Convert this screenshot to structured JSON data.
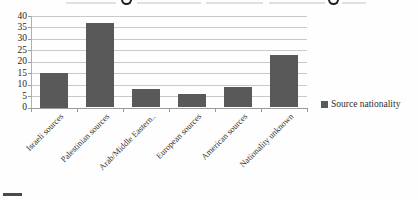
{
  "chart_data": {
    "type": "bar",
    "title": "",
    "title_note": "title cropped by screenshot edge; only letter descenders visible",
    "categories": [
      "Israeli sources",
      "Palestinian sources",
      "Arab/Middle Eastern..",
      "European sources",
      "American sources",
      "Nationality unknown"
    ],
    "values": [
      15,
      37,
      8,
      6,
      9,
      23
    ],
    "series": [
      {
        "name": "Source nationality",
        "values": [
          15,
          37,
          8,
          6,
          9,
          23
        ]
      }
    ],
    "xlabel": "",
    "ylabel": "",
    "ylim": [
      0,
      40
    ],
    "yticks": [
      0,
      5,
      10,
      15,
      20,
      25,
      30,
      35,
      40
    ],
    "grid": "horizontal",
    "legend_position": "right",
    "colors": {
      "bar": "#595959",
      "gridline": "#c9c9c9",
      "axis": "#9a9a9a",
      "tick_text": "#262626",
      "category_text": "#333333",
      "legend_text": "#2e2e2e"
    }
  },
  "legend": {
    "label": "Source nationality",
    "swatch_color": "#595959"
  },
  "artifacts": {
    "cropped_title_visible": "partial — descenders of two letters only, text not legible",
    "bottom_left_fragment": "small dark dash cropped at bottom-left edge"
  }
}
